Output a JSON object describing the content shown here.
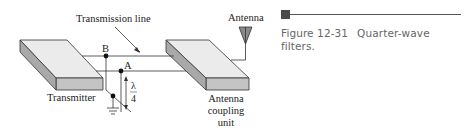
{
  "figure": {
    "number": "Figure 12-31",
    "caption": "Quarter-wave filters."
  },
  "labels": {
    "transmission_line": "Transmission line",
    "antenna": "Antenna",
    "transmitter": "Transmitter",
    "coupling_unit_line1": "Antenna",
    "coupling_unit_line2": "coupling",
    "coupling_unit_line3": "unit",
    "point_b": "B",
    "point_a": "A",
    "stub_length_num": "λ",
    "stub_length_den": "4"
  },
  "colors": {
    "box_top": "#ebebeb",
    "box_side": "#bdbdbd",
    "line": "#333333",
    "antenna_fill": "#8a8a8a",
    "caption_text": "#666666"
  }
}
